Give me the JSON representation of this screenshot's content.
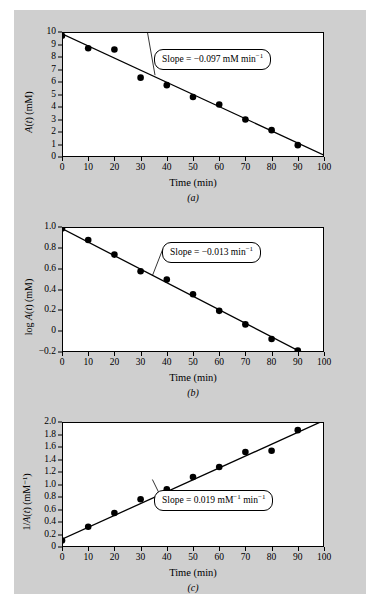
{
  "figure": {
    "background_color": "#cfcfcf",
    "plot_background_color": "#ffffff",
    "line_color": "#000000",
    "marker_color": "#000000"
  },
  "panels": [
    {
      "letter": "(a)",
      "ylabel_prefix": "",
      "ylabel_var": "A(t)",
      "ylabel_units": " (mM)",
      "xlabel": "Time (min)",
      "callout": "Slope = −0.097 mM min",
      "callout_sup": "−1"
    },
    {
      "letter": "(b)",
      "ylabel_prefix": "log ",
      "ylabel_var": "A(t)",
      "ylabel_units": " (mM)",
      "xlabel": "Time (min)",
      "callout": "Slope = −0.013  min",
      "callout_sup": "−1"
    },
    {
      "letter": "(c)",
      "ylabel_prefix": "1/",
      "ylabel_var": "A(t)",
      "ylabel_units": " (mM⁻¹)",
      "xlabel": "Time (min)",
      "callout": "Slope = 0.019 mM",
      "callout_sup": "−1",
      "callout2": " min",
      "callout2_sup": "−1"
    }
  ],
  "chart_data": [
    {
      "type": "scatter",
      "id": "panel-a",
      "title": "(a)",
      "xlabel": "Time (min)",
      "ylabel": "A(t) (mM)",
      "xlim": [
        0,
        100
      ],
      "ylim": [
        0,
        10
      ],
      "xticks": [
        0,
        10,
        20,
        30,
        40,
        50,
        60,
        70,
        80,
        90,
        100
      ],
      "yticks": [
        0,
        1,
        2,
        3,
        4,
        5,
        6,
        7,
        8,
        9,
        10
      ],
      "grid": false,
      "legend": "none",
      "annotation": "Slope = −0.097 mM min⁻¹",
      "x": [
        0,
        10,
        20,
        30,
        40,
        50,
        60,
        70,
        80,
        90
      ],
      "y": [
        9.7,
        8.7,
        8.6,
        6.35,
        5.75,
        4.8,
        4.2,
        3.0,
        2.15,
        0.95
      ],
      "fit_line": {
        "intercept": 9.85,
        "slope": -0.097
      }
    },
    {
      "type": "scatter",
      "id": "panel-b",
      "title": "(b)",
      "xlabel": "Time (min)",
      "ylabel": "log A(t) (mM)",
      "xlim": [
        0,
        100
      ],
      "ylim": [
        -0.2,
        1.0
      ],
      "xticks": [
        0,
        10,
        20,
        30,
        40,
        50,
        60,
        70,
        80,
        90,
        100
      ],
      "yticks": [
        -0.2,
        0,
        0.2,
        0.4,
        0.6,
        0.8,
        1.0
      ],
      "ytick_labels": [
        "−0.2",
        "0",
        "0.2",
        "0.4",
        "0.6",
        "0.8",
        "1.0"
      ],
      "grid": false,
      "legend": "none",
      "annotation": "Slope = −0.013  min⁻¹",
      "x": [
        0,
        10,
        20,
        30,
        40,
        50,
        60,
        70,
        80,
        90
      ],
      "y": [
        0.985,
        0.875,
        0.735,
        0.575,
        0.495,
        0.355,
        0.195,
        0.065,
        -0.075,
        -0.185
      ],
      "fit_line": {
        "intercept": 0.985,
        "slope": -0.013
      }
    },
    {
      "type": "scatter",
      "id": "panel-c",
      "title": "(c)",
      "xlabel": "Time (min)",
      "ylabel": "1/A(t) (mM⁻¹)",
      "xlim": [
        0,
        100
      ],
      "ylim": [
        0,
        2.0
      ],
      "xticks": [
        0,
        10,
        20,
        30,
        40,
        50,
        60,
        70,
        80,
        90,
        100
      ],
      "yticks": [
        0,
        0.2,
        0.4,
        0.6,
        0.8,
        1.0,
        1.2,
        1.4,
        1.6,
        1.8,
        2.0
      ],
      "ytick_labels": [
        "0",
        "0.2",
        "0.4",
        "0.6",
        "0.8",
        "1.0",
        "1.2",
        "1.4",
        "1.6",
        "1.8",
        "2.0"
      ],
      "grid": false,
      "legend": "none",
      "annotation": "Slope = 0.019 mM⁻¹ min⁻¹",
      "x": [
        0,
        10,
        20,
        30,
        40,
        50,
        60,
        70,
        80,
        90
      ],
      "y": [
        0.105,
        0.325,
        0.545,
        0.765,
        0.925,
        1.12,
        1.28,
        1.52,
        1.54,
        1.87
      ],
      "fit_line": {
        "intercept": 0.125,
        "slope": 0.019
      }
    }
  ]
}
